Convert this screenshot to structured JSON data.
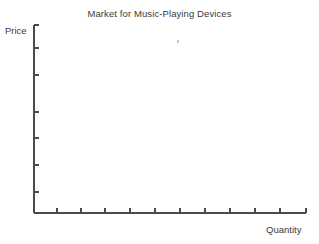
{
  "chart_data": {
    "type": "line",
    "title": "Market for Music-Playing Devices",
    "xlabel": "Quantity",
    "ylabel": "Price",
    "series": [],
    "categories": [],
    "values": [],
    "x_tick_labels": [],
    "y_tick_labels": [],
    "x_tick_count": 11,
    "y_tick_count": 7,
    "grid": false,
    "legend": "none",
    "note": "Empty supply-and-demand axes with no plotted curves or data points",
    "axis_color": "#4a4a4a",
    "background_color": "#ffffff",
    "text_color": "#3a3a3a"
  },
  "axes": {
    "origin_x": 34,
    "origin_y": 213,
    "y_axis_top": 25,
    "x_axis_right": 306,
    "y_tick_positions": [
      48,
      75,
      112,
      138,
      165,
      192
    ],
    "x_tick_positions": [
      57,
      81,
      105,
      130,
      155,
      180,
      205,
      230,
      255,
      280
    ],
    "tick_length": 5
  },
  "artifacts": {
    "speck_x": 177,
    "speck_y": 40
  }
}
